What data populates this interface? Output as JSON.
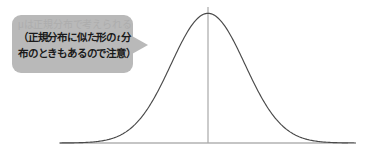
{
  "figure": {
    "background_color": "#ffffff",
    "callout": {
      "fill_color": "#b9b9b9",
      "tail_direction": "right",
      "faded_line": "μは正規分布で考えられる",
      "text_line_1_a": "（正規分布に似た形の",
      "text_line_1_italic": "t",
      "text_line_1_b": "分",
      "text_line_2": "布のときもあるので注意）",
      "text_color": "#1a1a1a",
      "faded_text_color": "#a9a9a9"
    },
    "chart_data": {
      "type": "line",
      "title": "",
      "xlabel": "",
      "ylabel": "",
      "curve_name": "normal-distribution-bell-curve",
      "curve_color": "#4a4a4a",
      "axis_color": "#8c8c8c",
      "baseline": {
        "x_start": 59,
        "x_end": 348,
        "y": 143
      },
      "mean_line": {
        "x": 208,
        "y_top": 7,
        "y_bottom": 143
      },
      "peak": {
        "x": 208,
        "y": 13
      },
      "x": [
        -4.0,
        -3.6,
        -3.2,
        -2.8,
        -2.4,
        -2.0,
        -1.6,
        -1.2,
        -0.8,
        -0.4,
        0.0,
        0.4,
        0.8,
        1.2,
        1.6,
        2.0,
        2.4,
        2.8,
        3.2,
        3.6,
        4.0
      ],
      "y": [
        0.0001,
        0.0006,
        0.0024,
        0.0079,
        0.0224,
        0.054,
        0.1109,
        0.1942,
        0.2897,
        0.3683,
        0.3989,
        0.3683,
        0.2897,
        0.1942,
        0.1109,
        0.054,
        0.0224,
        0.0079,
        0.0024,
        0.0006,
        0.0001
      ],
      "xlim": [
        -4.0,
        4.0
      ],
      "ylim": [
        0,
        0.4
      ],
      "grid": false,
      "legend": "none"
    }
  }
}
